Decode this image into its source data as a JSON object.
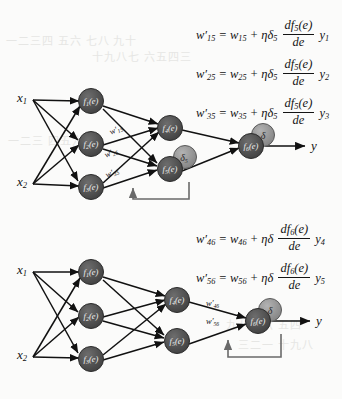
{
  "figure": {
    "type": "neural-network-backpropagation-diagram",
    "colors": {
      "page_background": "#fbfbfa",
      "node_fill": "#4a4a4a",
      "node_stroke": "#2c2c2c",
      "delta_badge_fill": "#8f8f8f",
      "delta_badge_stroke": "#5a5a5a",
      "edge": "#111111",
      "feedback_loop": "#6a6a6a",
      "text": "#141414",
      "bleed_through": "#e6e6e4"
    }
  },
  "upper_panel": {
    "inputs": [
      {
        "label": "x",
        "sub": "1"
      },
      {
        "label": "x",
        "sub": "2"
      }
    ],
    "layer1_nodes": [
      {
        "f": "f",
        "fsub": "1",
        "arg": "(e)"
      },
      {
        "f": "f",
        "fsub": "2",
        "arg": "(e)"
      },
      {
        "f": "f",
        "fsub": "3",
        "arg": "(e)"
      }
    ],
    "layer2_nodes": [
      {
        "f": "f",
        "fsub": "4",
        "arg": "(e)",
        "delta": null
      },
      {
        "f": "f",
        "fsub": "5",
        "arg": "(e)",
        "delta": "δ",
        "delta_sub": "5"
      }
    ],
    "output_node": {
      "f": "f",
      "fsub": "6",
      "arg": "(e)",
      "delta": "δ",
      "delta_sub": ""
    },
    "weight_labels": [
      {
        "w": "w",
        "prime": "′",
        "sub": "15"
      },
      {
        "w": "w",
        "prime": "′",
        "sub": "25"
      },
      {
        "w": "w",
        "prime": "′",
        "sub": "35"
      }
    ],
    "output_label": "y",
    "equations": [
      {
        "lhs_w": "w",
        "lhs_prime": "′",
        "lhs_sub": "15",
        "eq": "=",
        "rhs_w": "w",
        "rhs_sub": "15",
        "plus": "+",
        "eta": "η",
        "delta": "δ",
        "delta_sub": "5",
        "frac_num_df": "df",
        "frac_num_sub": "5",
        "frac_num_arg": "(e)",
        "frac_den": "de",
        "tail_y": "y",
        "tail_sub": "1"
      },
      {
        "lhs_w": "w",
        "lhs_prime": "′",
        "lhs_sub": "25",
        "eq": "=",
        "rhs_w": "w",
        "rhs_sub": "25",
        "plus": "+",
        "eta": "η",
        "delta": "δ",
        "delta_sub": "5",
        "frac_num_df": "df",
        "frac_num_sub": "5",
        "frac_num_arg": "(e)",
        "frac_den": "de",
        "tail_y": "y",
        "tail_sub": "2"
      },
      {
        "lhs_w": "w",
        "lhs_prime": "′",
        "lhs_sub": "35",
        "eq": "=",
        "rhs_w": "w",
        "rhs_sub": "35",
        "plus": "+",
        "eta": "η",
        "delta": "δ",
        "delta_sub": "5",
        "frac_num_df": "df",
        "frac_num_sub": "5",
        "frac_num_arg": "(e)",
        "frac_den": "de",
        "tail_y": "y",
        "tail_sub": "3"
      }
    ]
  },
  "lower_panel": {
    "inputs": [
      {
        "label": "x",
        "sub": "1"
      },
      {
        "label": "x",
        "sub": "2"
      }
    ],
    "layer1_nodes": [
      {
        "f": "f",
        "fsub": "1",
        "arg": "(e)"
      },
      {
        "f": "f",
        "fsub": "2",
        "arg": "(e)"
      },
      {
        "f": "f",
        "fsub": "3",
        "arg": "(e)"
      }
    ],
    "layer2_nodes": [
      {
        "f": "f",
        "fsub": "4",
        "arg": "(e)",
        "delta": null
      },
      {
        "f": "f",
        "fsub": "5",
        "arg": "(e)",
        "delta": null
      }
    ],
    "output_node": {
      "f": "f",
      "fsub": "6",
      "arg": "(e)",
      "delta": "δ",
      "delta_sub": ""
    },
    "weight_labels": [
      {
        "w": "w",
        "prime": "′",
        "sub": "46"
      },
      {
        "w": "w",
        "prime": "′",
        "sub": "56"
      }
    ],
    "output_label": "y",
    "equations": [
      {
        "lhs_w": "w",
        "lhs_prime": "′",
        "lhs_sub": "46",
        "eq": "=",
        "rhs_w": "w",
        "rhs_sub": "46",
        "plus": "+",
        "eta": "η",
        "delta": "δ",
        "delta_sub": "",
        "frac_num_df": "df",
        "frac_num_sub": "6",
        "frac_num_arg": "(e)",
        "frac_den": "de",
        "tail_y": "y",
        "tail_sub": "4"
      },
      {
        "lhs_w": "w",
        "lhs_prime": "′",
        "lhs_sub": "56",
        "eq": "=",
        "rhs_w": "w",
        "rhs_sub": "56",
        "plus": "+",
        "eta": "η",
        "delta": "δ",
        "delta_sub": "",
        "frac_num_df": "df",
        "frac_num_sub": "6",
        "frac_num_arg": "(e)",
        "frac_den": "de",
        "tail_y": "y",
        "tail_sub": "5"
      }
    ]
  },
  "bleed_text": {
    "line1": "一二三四 五六 七八 九十",
    "line2": "十九八七 六五四三",
    "line3": "一二三 四五六七",
    "line4": "九八七六 五四",
    "line5": "三二一 十九八"
  }
}
